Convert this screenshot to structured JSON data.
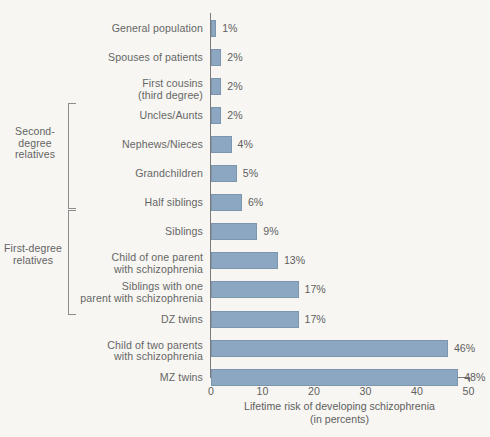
{
  "chart_data": {
    "type": "bar",
    "orientation": "horizontal",
    "title": "",
    "xlabel": "Lifetime risk of developing schizophrenia\n(in percents)",
    "ylabel": "",
    "xlim": [
      0,
      50
    ],
    "xticks": [
      0,
      10,
      20,
      30,
      40,
      50
    ],
    "xtick_labels": [
      "0",
      "10",
      "20",
      "30",
      "40",
      "50"
    ],
    "grid": false,
    "legend": null,
    "value_label_suffix": "%",
    "categories": [
      "General population",
      "Spouses of patients",
      "First cousins\n(third degree)",
      "Uncles/Aunts",
      "Nephews/Nieces",
      "Grandchildren",
      "Half siblings",
      "Siblings",
      "Child of one parent\nwith schizophrenia",
      "Siblings with one\nparent with schizophrenia",
      "DZ twins",
      "Child of two parents\nwith schizophrenia",
      "MZ twins"
    ],
    "values": [
      1,
      2,
      2,
      2,
      4,
      5,
      6,
      9,
      13,
      17,
      17,
      46,
      48
    ],
    "value_labels": [
      "1%",
      "2%",
      "2%",
      "2%",
      "4%",
      "5%",
      "6%",
      "9%",
      "13%",
      "17%",
      "17%",
      "46%",
      "48%"
    ],
    "bar_color": "#8ca7c2",
    "bar_border_color": "#7d95ad",
    "axis_color": "#7a7a7a",
    "background_color": "#f7f6f2",
    "text_color": "#666666"
  },
  "groups": [
    {
      "label": "Second-\ndegree\nrelatives",
      "first_index": 3,
      "last_index": 6
    },
    {
      "label": "First-degree\nrelatives",
      "first_index": 7,
      "last_index": 10
    }
  ]
}
